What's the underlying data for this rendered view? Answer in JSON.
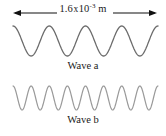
{
  "figure": {
    "background_color": "#ffffff",
    "dimension": {
      "arrow_style": "double-headed",
      "label_prefix": "1.6",
      "label_multiply": "x",
      "label_base": "10",
      "label_exponent": "-3",
      "label_unit": "m",
      "label_full": "1.6 x 10-3 m",
      "color": "#111111",
      "x_start": 13,
      "x_end": 157
    },
    "waves": [
      {
        "id": "wave-a",
        "caption": "Wave a",
        "cycles": 4,
        "amplitude": 15,
        "stroke_color": "#6b6b6b",
        "stroke_width": 1.3,
        "baseline": 19,
        "x_start": 13,
        "x_end": 158
      },
      {
        "id": "wave-b",
        "caption": "Wave b",
        "cycles": 8,
        "amplitude": 12,
        "stroke_color": "#9a9a9a",
        "stroke_width": 1.2,
        "baseline": 16,
        "x_start": 13,
        "x_end": 158
      }
    ]
  }
}
